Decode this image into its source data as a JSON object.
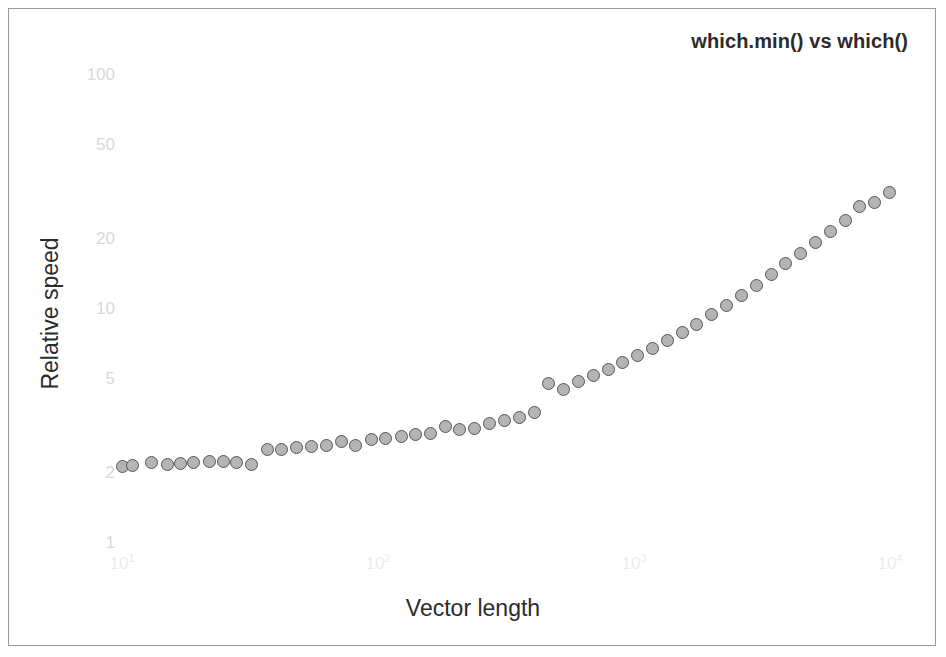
{
  "chart_data": {
    "type": "scatter",
    "title": "which.min() vs which()",
    "xlabel": "Vector length",
    "ylabel": "Relative speed",
    "xscale": "log",
    "yscale": "log",
    "xlim": [
      9,
      11000
    ],
    "ylim": [
      1,
      115
    ],
    "grid": false,
    "legend": null,
    "xticks": [
      {
        "value": 10,
        "label": "10",
        "exp": "1"
      },
      {
        "value": 100,
        "label": "10",
        "exp": "2"
      },
      {
        "value": 1000,
        "label": "10",
        "exp": "3"
      },
      {
        "value": 10000,
        "label": "10",
        "exp": "4"
      }
    ],
    "yticks": [
      {
        "value": 100,
        "label": "100"
      },
      {
        "value": 50,
        "label": "50"
      },
      {
        "value": 20,
        "label": "20"
      },
      {
        "value": 10,
        "label": "10"
      },
      {
        "value": 5,
        "label": "5"
      },
      {
        "value": 2,
        "label": "2"
      },
      {
        "value": 1,
        "label": "1"
      }
    ],
    "series": [
      {
        "name": "relative speed",
        "marker": "filled-circle",
        "marker_fill": "#b4b4b4",
        "marker_edge": "#555555",
        "x": [
          10,
          11,
          13,
          15,
          17,
          19,
          22,
          25,
          28,
          32,
          37,
          42,
          48,
          55,
          63,
          72,
          82,
          94,
          107,
          123,
          140,
          160,
          183,
          209,
          239,
          273,
          312,
          356,
          407,
          465,
          531,
          607,
          693,
          792,
          905,
          1034,
          1181,
          1350,
          1542,
          1762,
          2013,
          2300,
          2628,
          3002,
          3430,
          3919,
          4477,
          5115,
          5844,
          6677,
          7629,
          8716,
          9958
        ],
        "y": [
          2.13,
          2.14,
          2.2,
          2.17,
          2.18,
          2.2,
          2.22,
          2.24,
          2.2,
          2.16,
          2.5,
          2.52,
          2.55,
          2.58,
          2.62,
          2.72,
          2.6,
          2.78,
          2.8,
          2.85,
          2.9,
          2.95,
          3.15,
          3.05,
          3.1,
          3.25,
          3.35,
          3.45,
          3.6,
          4.8,
          4.55,
          4.9,
          5.2,
          5.5,
          5.9,
          6.3,
          6.8,
          7.3,
          7.9,
          8.6,
          9.5,
          10.4,
          11.4,
          12.6,
          14.0,
          15.6,
          17.3,
          19.3,
          21.5,
          24.0,
          27.5,
          28.5,
          31.5
        ]
      }
    ]
  }
}
